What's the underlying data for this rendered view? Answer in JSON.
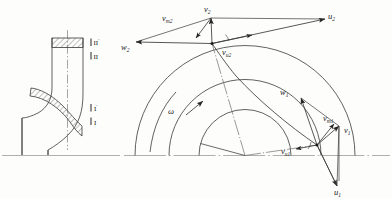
{
  "figure": {
    "background_color": "#fdfdfc",
    "line_color": "#3a3a3a",
    "label_color": "#1b1b1b"
  },
  "meridional_view": {
    "name": "meridional-section",
    "section_labels": [
      {
        "id": "outlet-prime",
        "text": "II",
        "prime": "'"
      },
      {
        "id": "outlet",
        "text": "II",
        "prime": ""
      },
      {
        "id": "inlet-prime",
        "text": "I",
        "prime": "'"
      },
      {
        "id": "inlet",
        "text": "I",
        "prime": ""
      }
    ],
    "hatched_regions": [
      "outlet-blade-section",
      "inlet-blade-section"
    ],
    "axis_type": "dash-dot centerline"
  },
  "plan_view": {
    "name": "impeller-plan-view",
    "center": {
      "x": 245,
      "y": 156
    },
    "circles": [
      {
        "id": "hub-circle",
        "radius": 46
      },
      {
        "id": "inlet-circle",
        "radius": 76
      },
      {
        "id": "outlet-circle",
        "radius": 110
      }
    ],
    "rotation": {
      "symbol": "ω",
      "direction": "counter-clockwise"
    },
    "blade": {
      "id": "blade-curve",
      "from": "inlet-point",
      "to": "outlet-point"
    },
    "baseline": "horizontal dash-dot centerline"
  },
  "outlet_triangle": {
    "name": "outlet-velocity-triangle",
    "apex": {
      "x": 212,
      "y": 43
    },
    "vectors": [
      {
        "id": "u2",
        "symbol": "u",
        "sub": "2",
        "label_x": 330,
        "label_y": 16
      },
      {
        "id": "v2",
        "symbol": "v",
        "sub": "2",
        "label_x": 208,
        "label_y": 10
      },
      {
        "id": "w2",
        "symbol": "w",
        "sub": "2",
        "label_x": 124,
        "label_y": 48
      },
      {
        "id": "vm2",
        "symbol": "v",
        "sub": "m2",
        "label_x": 165,
        "label_y": 18
      },
      {
        "id": "vu2",
        "symbol": "v",
        "sub": "u2",
        "label_x": 220,
        "label_y": 52
      }
    ]
  },
  "inlet_triangle": {
    "name": "inlet-velocity-triangle",
    "apex": {
      "x": 317,
      "y": 145
    },
    "vectors": [
      {
        "id": "u1",
        "symbol": "u",
        "sub": "1",
        "label_x": 340,
        "label_y": 193
      },
      {
        "id": "v1",
        "symbol": "v",
        "sub": "1",
        "label_x": 345,
        "label_y": 131
      },
      {
        "id": "w1",
        "symbol": "w",
        "sub": "1",
        "label_x": 283,
        "label_y": 92
      },
      {
        "id": "vm1",
        "symbol": "v",
        "sub": "m1",
        "label_x": 326,
        "label_y": 119
      },
      {
        "id": "vu1",
        "symbol": "v",
        "sub": "u1",
        "label_x": 286,
        "label_y": 151
      }
    ]
  }
}
